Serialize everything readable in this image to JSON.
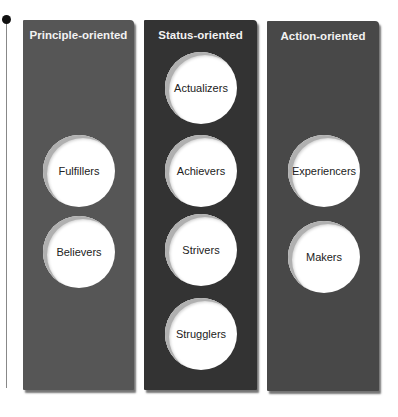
{
  "columns": [
    {
      "title": "Principle-oriented",
      "color": "#565656",
      "segments": [
        "Fulfillers",
        "Believers"
      ]
    },
    {
      "title": "Status-oriented",
      "color": "#333333",
      "segments": [
        "Actualizers",
        "Achievers",
        "Strivers",
        "Strugglers"
      ]
    },
    {
      "title": "Action-oriented",
      "color": "#484848",
      "segments": [
        "Experiencers",
        "Makers"
      ]
    }
  ]
}
